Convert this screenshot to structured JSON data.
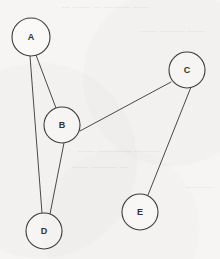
{
  "diagram": {
    "type": "undirected-graph",
    "title": "",
    "background_color": "#f6f5f3",
    "stroke_color": "#3c3c3c",
    "edge_color": "#4a4a4a",
    "node_fill": "#faf9f7",
    "label_color": "#333333",
    "nodes": [
      {
        "id": "A",
        "label": "A",
        "cx": 31,
        "cy": 37,
        "r": 19
      },
      {
        "id": "B",
        "label": "B",
        "cx": 62,
        "cy": 125,
        "r": 18
      },
      {
        "id": "C",
        "label": "C",
        "cx": 187,
        "cy": 70,
        "r": 18
      },
      {
        "id": "D",
        "label": "D",
        "cx": 44,
        "cy": 231,
        "r": 18
      },
      {
        "id": "E",
        "label": "E",
        "cx": 140,
        "cy": 212,
        "r": 18
      }
    ],
    "edges": [
      {
        "id": "A-B",
        "from": "A",
        "to": "B",
        "x1": 36,
        "y1": 55,
        "x2": 56,
        "y2": 108
      },
      {
        "id": "A-D",
        "from": "A",
        "to": "D",
        "x1": 30,
        "y1": 56,
        "x2": 42,
        "y2": 213
      },
      {
        "id": "B-D",
        "from": "B",
        "to": "D",
        "x1": 64,
        "y1": 143,
        "x2": 50,
        "y2": 214
      },
      {
        "id": "B-C",
        "from": "B",
        "to": "C",
        "x1": 80,
        "y1": 131,
        "x2": 171,
        "y2": 82
      },
      {
        "id": "C-E",
        "from": "C",
        "to": "E",
        "x1": 191,
        "y1": 87,
        "x2": 148,
        "y2": 195
      }
    ],
    "background_marks": [
      {
        "text": "—  ——  — ———  ——",
        "x": 62,
        "y": 6
      },
      {
        "text": "——  ——— ——",
        "x": 140,
        "y": 30
      },
      {
        "text": "——  ————  ———",
        "x": 78,
        "y": 150
      },
      {
        "text": "——  ———  —",
        "x": 72,
        "y": 166
      },
      {
        "text": "———",
        "x": 186,
        "y": 186
      }
    ]
  }
}
